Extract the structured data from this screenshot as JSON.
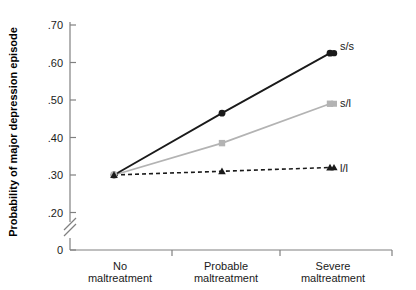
{
  "chart_data": {
    "type": "line",
    "title": "",
    "xlabel": "",
    "ylabel": "Probability of major depression episode",
    "categories": [
      "No maltreatment",
      "Probable maltreatment",
      "Severe maltreatment"
    ],
    "category_lines": [
      [
        "No",
        "maltreatment"
      ],
      [
        "Probable",
        "maltreatment"
      ],
      [
        "Severe",
        "maltreatment"
      ]
    ],
    "ylim": [
      0.2,
      0.7
    ],
    "yticks": [
      0.7,
      0.6,
      0.5,
      0.4,
      0.3,
      0.2,
      0
    ],
    "ytick_labels": [
      ".70",
      ".60",
      ".50",
      ".40",
      ".30",
      ".20",
      "0"
    ],
    "axis_break": true,
    "grid": false,
    "legend_position": "right-inline",
    "series": [
      {
        "name": "s/s",
        "values": [
          0.3,
          0.465,
          0.625
        ],
        "color": "#1a1a1a",
        "marker": "circle",
        "line_style": "solid"
      },
      {
        "name": "s/l",
        "values": [
          0.3,
          0.385,
          0.49
        ],
        "color": "#b3b3b3",
        "marker": "square",
        "line_style": "solid"
      },
      {
        "name": "l/l",
        "values": [
          0.3,
          0.31,
          0.32
        ],
        "color": "#1a1a1a",
        "marker": "triangle",
        "line_style": "dashed"
      }
    ]
  },
  "labels": {
    "y_axis_title": "Probability of major depression episode",
    "ytick_0": ".70",
    "ytick_1": ".60",
    "ytick_2": ".50",
    "ytick_3": ".40",
    "ytick_4": ".30",
    "ytick_5": ".20",
    "ytick_6": "0",
    "cat_0_line_0": "No",
    "cat_0_line_1": "maltreatment",
    "cat_1_line_0": "Probable",
    "cat_1_line_1": "maltreatment",
    "cat_2_line_0": "Severe",
    "cat_2_line_1": "maltreatment",
    "series_0_label": "s/s",
    "series_1_label": "s/l",
    "series_2_label": "l/l"
  }
}
